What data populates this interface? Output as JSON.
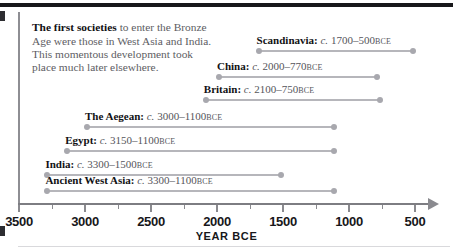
{
  "figure": {
    "intro_bold": "The first societies",
    "intro_rest": " to enter the Bronze Age were those in West Asia and India. This momentous development took place much later elsewhere."
  },
  "chart_data": {
    "type": "bar",
    "title": "",
    "xlabel": "YEAR BCE",
    "ylabel": "",
    "orientation": "horizontal-ranges",
    "axis_direction": "reversed",
    "xlim": [
      3500,
      500
    ],
    "grid": false,
    "legend": null,
    "tick_labels": [
      "3500",
      "3000",
      "2500",
      "2000",
      "1500",
      "1000",
      "500"
    ],
    "tick_values": [
      3500,
      3000,
      2500,
      2000,
      1500,
      1000,
      500
    ],
    "minor_tick_values": [
      3250,
      2750,
      2250,
      1750,
      1250,
      750
    ],
    "categories": [
      "Scandinavia",
      "China",
      "Britain",
      "The Aegean",
      "Egypt",
      "India",
      "Ancient West Asia"
    ],
    "series": [
      {
        "name": "Bronze Age span",
        "ranges": [
          {
            "label": "Scandinavia",
            "start": 1700,
            "end": 500,
            "label_text": "Scandinavia: c. 1700–500 BCE",
            "region": "Scandinavia:",
            "circa": "c.",
            "range_text": "1700–500",
            "era": "BCE"
          },
          {
            "label": "China",
            "start": 2000,
            "end": 770,
            "label_text": "China: c. 2000–770 BCE",
            "region": "China:",
            "circa": "c.",
            "range_text": "2000–770",
            "era": "BCE"
          },
          {
            "label": "Britain",
            "start": 2100,
            "end": 750,
            "label_text": "Britain: c. 2100–750 BCE",
            "region": "Britain:",
            "circa": "c.",
            "range_text": "2100–750",
            "era": "BCE"
          },
          {
            "label": "The Aegean",
            "start": 3000,
            "end": 1100,
            "label_text": "The Aegean: c. 3000–1100 BCE",
            "region": "The Aegean:",
            "circa": "c.",
            "range_text": "3000–1100",
            "era": "BCE"
          },
          {
            "label": "Egypt",
            "start": 3150,
            "end": 1100,
            "label_text": "Egypt: c. 3150–1100 BCE",
            "region": "Egypt:",
            "circa": "c.",
            "range_text": "3150–1100",
            "era": "BCE"
          },
          {
            "label": "India",
            "start": 3300,
            "end": 1500,
            "label_text": "India: c. 3300–1500 BCE",
            "region": "India:",
            "circa": "c.",
            "range_text": "3300–1500",
            "era": "BCE"
          },
          {
            "label": "Ancient West Asia",
            "start": 3300,
            "end": 1100,
            "label_text": "Ancient West Asia: c. 3300–1100 BCE",
            "region": "Ancient West Asia:",
            "circa": "c.",
            "range_text": "3300–1100",
            "era": "BCE"
          }
        ]
      }
    ]
  }
}
